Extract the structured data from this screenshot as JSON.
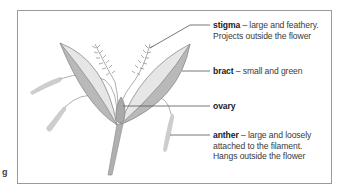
{
  "diagram": {
    "labels": [
      {
        "term": "stigma",
        "description": " – large and feathery.",
        "line2": "Projects outside the flower",
        "line3": ""
      },
      {
        "term": "bract",
        "description": " – small and green",
        "line2": "",
        "line3": ""
      },
      {
        "term": "ovary",
        "description": "",
        "line2": "",
        "line3": ""
      },
      {
        "term": "anther",
        "description": " – large and loosely",
        "line2": "attached to the filament.",
        "line3": "Hangs outside the flower"
      }
    ],
    "edge_mark": "g",
    "colors": {
      "frame": "#9a9a9a",
      "bract_fill": "#b9b9b9",
      "bract_inner": "#e6e6e6",
      "outline": "#8a8a8a",
      "anther": "#c4c4c4",
      "leader_line": "#555555",
      "text": "#3a3a3a"
    }
  }
}
